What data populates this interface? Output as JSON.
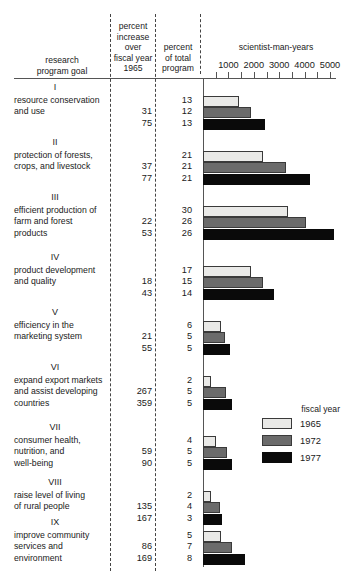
{
  "header": {
    "col_goal": "research\nprogram goal",
    "col_goal_line1": "research",
    "col_goal_line2": "program goal",
    "col_increase_line1": "percent",
    "col_increase_line2": "increase",
    "col_increase_line3": "over",
    "col_increase_line4": "fiscal year",
    "col_increase_line5": "1965",
    "col_total_line1": "percent",
    "col_total_line2": "of total",
    "col_total_line3": "program",
    "axis_title": "scientist-man-years"
  },
  "legend": {
    "title": "fiscal year",
    "items": [
      {
        "label": "1965",
        "color": "#e9e9e7"
      },
      {
        "label": "1972",
        "color": "#6b6b6b"
      },
      {
        "label": "1977",
        "color": "#0a0a0a"
      }
    ]
  },
  "chart_data": {
    "type": "bar",
    "title": "scientist-man-years",
    "xlabel": "scientist-man-years",
    "ylabel": "research program goal",
    "xlim": [
      0,
      5500
    ],
    "ticks": [
      0,
      500,
      1000,
      1500,
      2000,
      2500,
      3000,
      3500,
      4000,
      4500,
      5000
    ],
    "tick_labels": [
      "1000",
      "2000",
      "3000",
      "4000",
      "5000"
    ],
    "tick_label_values": [
      1000,
      2000,
      3000,
      4000,
      5000
    ],
    "grid": false,
    "legend_position": "right",
    "series": [
      {
        "name": "1965",
        "color": "#e9e9e7"
      },
      {
        "name": "1972",
        "color": "#6b6b6b"
      },
      {
        "name": "1977",
        "color": "#0a0a0a"
      }
    ],
    "categories": [
      "I resource conservation and use",
      "II protection of forests, crops, and livestock",
      "III efficient production of farm and forest products",
      "IV product development and quality",
      "V efficiency in the marketing system",
      "VI expand export markets and assist developing countries",
      "VII consumer health, nutrition, and well-being",
      "VIII raise level of living of rural people",
      "IX improve community services and environment"
    ],
    "rows": [
      {
        "numeral": "I",
        "label_lines": [
          "resource conservation",
          "and use"
        ],
        "percent_increase": [
          "",
          "31",
          "75"
        ],
        "percent_of_total": [
          "13",
          "12",
          "13"
        ],
        "values": [
          1400,
          1900,
          2450
        ]
      },
      {
        "numeral": "II",
        "label_lines": [
          "protection of forests,",
          "crops, and livestock"
        ],
        "percent_increase": [
          "",
          "37",
          "77"
        ],
        "percent_of_total": [
          "21",
          "21",
          "21"
        ],
        "values": [
          2350,
          3250,
          4200
        ]
      },
      {
        "numeral": "III",
        "label_lines": [
          "efficient production of",
          "farm and forest",
          "products"
        ],
        "percent_increase": [
          "",
          "22",
          "53"
        ],
        "percent_of_total": [
          "30",
          "26",
          "26"
        ],
        "values": [
          3350,
          4050,
          5150
        ]
      },
      {
        "numeral": "IV",
        "label_lines": [
          "product development",
          "and quality"
        ],
        "percent_increase": [
          "",
          "18",
          "43"
        ],
        "percent_of_total": [
          "17",
          "15",
          "14"
        ],
        "values": [
          1900,
          2350,
          2800
        ]
      },
      {
        "numeral": "V",
        "label_lines": [
          "efficiency in the",
          "marketing system"
        ],
        "percent_increase": [
          "",
          "21",
          "55"
        ],
        "percent_of_total": [
          "6",
          "5",
          "5"
        ],
        "values": [
          700,
          850,
          1050
        ]
      },
      {
        "numeral": "VI",
        "label_lines": [
          "expand export markets",
          "and assist developing",
          "countries"
        ],
        "percent_increase": [
          "",
          "267",
          "359"
        ],
        "percent_of_total": [
          "2",
          "5",
          "5"
        ],
        "values": [
          300,
          900,
          1150
        ]
      },
      {
        "numeral": "VII",
        "label_lines": [
          "consumer health,",
          "nutrition, and",
          "well-being"
        ],
        "percent_increase": [
          "",
          "59",
          "90"
        ],
        "percent_of_total": [
          "4",
          "5",
          "5"
        ],
        "values": [
          500,
          950,
          1150
        ]
      },
      {
        "numeral": "VIII",
        "label_lines": [
          "raise level of living",
          "of rural people"
        ],
        "percent_increase": [
          "",
          "135",
          "167"
        ],
        "percent_of_total": [
          "2",
          "4",
          "3"
        ],
        "values": [
          300,
          650,
          750
        ]
      },
      {
        "numeral": "IX",
        "label_lines": [
          "improve community",
          "services and",
          "environment"
        ],
        "percent_increase": [
          "",
          "86",
          "169"
        ],
        "percent_of_total": [
          "5",
          "7",
          "8"
        ],
        "values": [
          700,
          1150,
          1650
        ]
      }
    ]
  },
  "layout": {
    "dividers_x": [
      110,
      155,
      200
    ],
    "axis_origin_x": 203,
    "px_per_1000": 25.4,
    "row_tops": [
      96,
      151,
      206,
      266,
      321,
      376,
      436,
      491,
      531
    ]
  }
}
